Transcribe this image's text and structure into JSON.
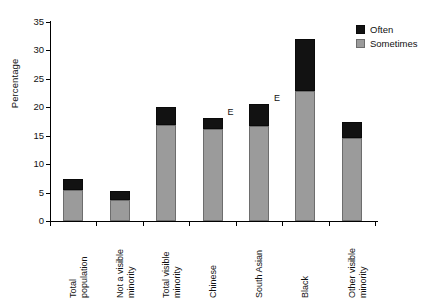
{
  "chart_data": {
    "type": "bar",
    "stacked": true,
    "title": "",
    "subtitle": "",
    "xlabel": "",
    "ylabel": "Percentage",
    "ylim": [
      0,
      35
    ],
    "yticks": [
      0,
      5,
      10,
      15,
      20,
      25,
      30,
      35
    ],
    "grid": false,
    "legend_position": "top-right",
    "categories": [
      "Total\npopulation",
      "Not a visible\nminority",
      "Total visible\nminority",
      "Chinese",
      "South Asian",
      "Black",
      "Other visible\nminority"
    ],
    "series": [
      {
        "name": "Sometimes",
        "color": "#9b9b9b",
        "values": [
          5.4,
          3.7,
          16.9,
          16.2,
          16.7,
          22.8,
          14.6
        ]
      },
      {
        "name": "Often",
        "color": "#121212",
        "values": [
          2.0,
          1.5,
          3.1,
          1.9,
          3.9,
          9.2,
          2.8
        ]
      }
    ],
    "totals": [
      7.4,
      5.2,
      20.0,
      18.1,
      20.6,
      32.0,
      17.4
    ],
    "annotations": [
      {
        "category_index": 3,
        "text": "E"
      },
      {
        "category_index": 4,
        "text": "E"
      }
    ]
  },
  "legend": {
    "items": [
      {
        "label": "Often",
        "swatch": "often"
      },
      {
        "label": "Sometimes",
        "swatch": "sometimes"
      }
    ]
  },
  "axis": {
    "y_labels": [
      "0",
      "5",
      "10",
      "15",
      "20",
      "25",
      "30",
      "35"
    ],
    "y_title": "Percentage"
  },
  "x_labels": [
    "Total\npopulation",
    "Not a visible\nminority",
    "Total visible\nminority",
    "Chinese",
    "South Asian",
    "Black",
    "Other visible\nminority"
  ]
}
